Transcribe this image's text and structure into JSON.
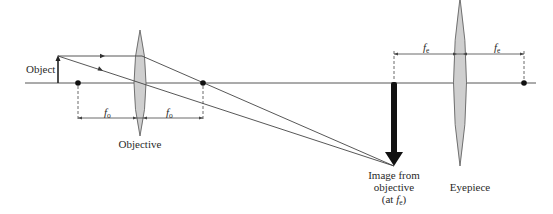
{
  "diagram": {
    "labels": {
      "object": "Object",
      "objective": "Objective",
      "eyepiece": "Eyepiece",
      "image_line1": "Image from",
      "image_line2": "objective",
      "image_line3_prefix": "(at ",
      "image_line3_suffix": ")",
      "focal_symbol": "f",
      "objective_sub": "o",
      "eyepiece_sub": "e"
    },
    "colors": {
      "line": "#3a3a3a",
      "lens_fill": "#cfcfcf",
      "lens_stroke": "#555555",
      "image_arrow": "#111111",
      "background": "#ffffff"
    }
  }
}
